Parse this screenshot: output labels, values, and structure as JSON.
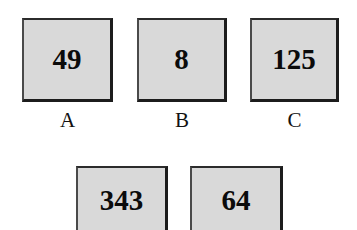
{
  "figure": {
    "background_color": "#ffffff",
    "box_fill_color": "#d9d9d9",
    "box_border_color": "#1c1c1c",
    "text_color": "#0b0b0b",
    "width": 357,
    "height": 230
  },
  "rows": {
    "top": {
      "boxes": [
        {
          "value": "49",
          "label": "A",
          "x": 22,
          "y": 18,
          "w": 91,
          "h": 84
        },
        {
          "value": "8",
          "label": "B",
          "x": 137,
          "y": 18,
          "w": 90,
          "h": 84
        },
        {
          "value": "125",
          "label": "C",
          "x": 250,
          "y": 18,
          "w": 89,
          "h": 84
        }
      ],
      "label_y": 110
    },
    "bottom": {
      "boxes": [
        {
          "value": "343",
          "label": "",
          "x": 76,
          "y": 166,
          "w": 92,
          "h": 70
        },
        {
          "value": "64",
          "label": "",
          "x": 190,
          "y": 166,
          "w": 93,
          "h": 70
        }
      ]
    }
  },
  "values_all": [
    "49",
    "8",
    "125",
    "343",
    "64"
  ],
  "labels_all": [
    "A",
    "B",
    "C"
  ]
}
